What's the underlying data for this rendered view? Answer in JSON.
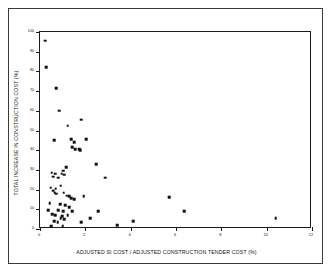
{
  "chart_data": {
    "type": "scatter",
    "title": "",
    "xlabel": "ADJUSTED SI COST / ADJUSTED CONSTRUCTION TENDER COST (%)",
    "ylabel": "TOTAL INCREASE IN CONSTRUCTION COST (%)",
    "xlim": [
      0,
      12
    ],
    "ylim": [
      0,
      100
    ],
    "xticks": [
      0,
      2,
      4,
      6,
      8,
      10,
      12
    ],
    "yticks": [
      0,
      10,
      20,
      30,
      40,
      50,
      60,
      70,
      80,
      90,
      100
    ],
    "xtick_labels": [
      "0",
      "2",
      "4",
      "6",
      "8",
      "10",
      "12"
    ],
    "ytick_labels": [
      "0",
      "10",
      "20",
      "30",
      "40",
      "50",
      "60",
      "70",
      "80",
      "90",
      "100"
    ],
    "grid": false,
    "legend": null,
    "marker": "square",
    "marker_color": "#111111",
    "frame_color": "#1a1a1a",
    "background": "#ffffff",
    "n_points": 62,
    "points": [
      [
        0.22,
        95.5
      ],
      [
        0.28,
        82.0
      ],
      [
        0.72,
        71.5
      ],
      [
        0.85,
        60.0
      ],
      [
        1.82,
        55.5
      ],
      [
        1.22,
        52.5
      ],
      [
        0.62,
        45.0
      ],
      [
        1.38,
        45.5
      ],
      [
        1.52,
        44.0
      ],
      [
        2.05,
        45.5
      ],
      [
        1.42,
        41.5
      ],
      [
        1.55,
        40.5
      ],
      [
        1.72,
        40.5
      ],
      [
        1.78,
        40.0
      ],
      [
        2.48,
        33.0
      ],
      [
        1.15,
        31.5
      ],
      [
        1.02,
        29.5
      ],
      [
        0.52,
        28.5
      ],
      [
        0.66,
        28.0
      ],
      [
        0.95,
        28.0
      ],
      [
        1.08,
        27.5
      ],
      [
        0.58,
        26.5
      ],
      [
        0.8,
        26.0
      ],
      [
        2.88,
        26.0
      ],
      [
        0.92,
        22.0
      ],
      [
        0.48,
        21.0
      ],
      [
        0.7,
        20.5
      ],
      [
        0.58,
        19.5
      ],
      [
        0.64,
        18.5
      ],
      [
        0.72,
        18.0
      ],
      [
        1.05,
        18.5
      ],
      [
        1.18,
        17.0
      ],
      [
        1.28,
        16.5
      ],
      [
        1.92,
        16.5
      ],
      [
        1.38,
        15.5
      ],
      [
        1.5,
        15.0
      ],
      [
        5.7,
        16.0
      ],
      [
        0.42,
        13.0
      ],
      [
        0.88,
        12.5
      ],
      [
        1.12,
        12.0
      ],
      [
        1.3,
        11.0
      ],
      [
        0.35,
        9.5
      ],
      [
        0.8,
        9.5
      ],
      [
        1.02,
        9.0
      ],
      [
        1.42,
        9.0
      ],
      [
        2.58,
        9.0
      ],
      [
        6.35,
        9.0
      ],
      [
        0.55,
        7.5
      ],
      [
        0.68,
        7.0
      ],
      [
        0.98,
        6.5
      ],
      [
        1.22,
        7.0
      ],
      [
        0.92,
        5.5
      ],
      [
        1.08,
        5.0
      ],
      [
        2.22,
        5.5
      ],
      [
        10.4,
        5.5
      ],
      [
        0.62,
        4.0
      ],
      [
        0.78,
        3.5
      ],
      [
        1.82,
        3.5
      ],
      [
        4.1,
        4.0
      ],
      [
        0.5,
        1.5
      ],
      [
        1.0,
        1.5
      ],
      [
        3.4,
        2.0
      ]
    ]
  }
}
